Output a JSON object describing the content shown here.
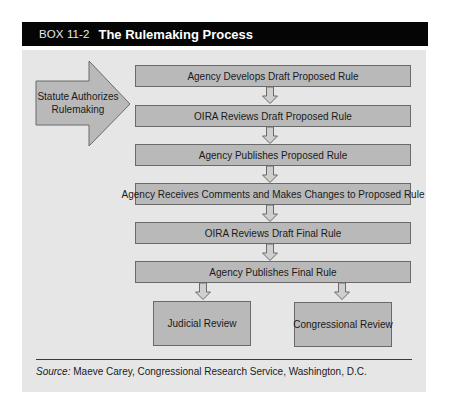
{
  "header": {
    "box_number": "BOX 11-2",
    "title": "The Rulemaking Process"
  },
  "start": {
    "label_line1": "Statute Authorizes",
    "label_line2": "Rulemaking",
    "shape": "right-arrow"
  },
  "steps": [
    {
      "label": "Agency Develops Draft Proposed Rule"
    },
    {
      "label": "OIRA Reviews Draft Proposed Rule"
    },
    {
      "label": "Agency Publishes Proposed Rule"
    },
    {
      "label": "Agency Receives Comments and Makes Changes to Proposed Rule"
    },
    {
      "label": "OIRA Reviews Draft Final Rule"
    },
    {
      "label": "Agency Publishes Final Rule"
    }
  ],
  "reviews": [
    {
      "label": "Judicial Review"
    },
    {
      "label": "Congressional Review"
    }
  ],
  "source": {
    "label": "Source:",
    "text": " Maeve Carey, Congressional Research Service, Washington, D.C."
  },
  "colors": {
    "header_bg": "#050505",
    "panel_bg": "#e6e6e6",
    "box_fill": "#b9b9b9",
    "box_border": "#6a6a6a"
  }
}
